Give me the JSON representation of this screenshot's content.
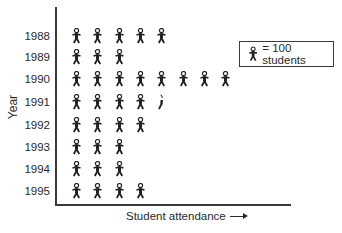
{
  "chart_data": {
    "type": "pictograph",
    "title": "",
    "xlabel": "Student attendance",
    "ylabel": "Year",
    "unit_value": 100,
    "legend": "= 100 students",
    "categories": [
      "1988",
      "1989",
      "1990",
      "1991",
      "1992",
      "1993",
      "1994",
      "1995"
    ],
    "icon_counts": [
      5,
      3,
      8,
      4.5,
      4,
      3,
      3,
      4
    ],
    "values": [
      500,
      300,
      800,
      450,
      400,
      300,
      300,
      400
    ],
    "grid": false,
    "legend_position": "upper right"
  },
  "labels": {
    "ylabel": "Year",
    "xlabel": "Student attendance",
    "legend_text": "= 100 students",
    "years": [
      "1988",
      "1989",
      "1990",
      "1991",
      "1992",
      "1993",
      "1994",
      "1995"
    ]
  },
  "colors": {
    "ink": "#2a2a2a",
    "background": "#ffffff"
  }
}
